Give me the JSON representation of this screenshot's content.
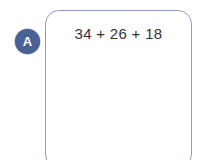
{
  "item": {
    "label": "A",
    "label_color": "#4a6196",
    "label_text_color": "#ffffff"
  },
  "answer_box": {
    "border_color": "#8b9dc3",
    "background_color": "#ffffff",
    "expression": "34 + 26 + 18",
    "expression_color": "#333333"
  },
  "page": {
    "background_color": "#ffffff"
  }
}
